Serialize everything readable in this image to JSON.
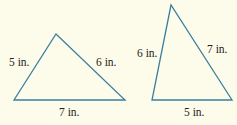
{
  "colors": {
    "background": "#FDFBEA",
    "line": "#3A7FA0",
    "text": "#222222"
  },
  "triangles": [
    {
      "name": "left-triangle",
      "vertices": [
        [
          14,
          100
        ],
        [
          56,
          34
        ],
        [
          125,
          100
        ]
      ],
      "labels": {
        "left_side": "5 in.",
        "right_side": "6 in.",
        "base": "7 in."
      }
    },
    {
      "name": "right-triangle",
      "vertices": [
        [
          171,
          5
        ],
        [
          152,
          100
        ],
        [
          232,
          100
        ]
      ],
      "labels": {
        "left_side": "6 in.",
        "right_side": "7 in.",
        "base": "5 in."
      }
    }
  ]
}
